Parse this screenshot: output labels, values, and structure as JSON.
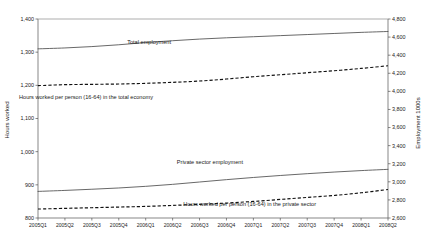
{
  "chart_data": {
    "type": "line",
    "title": "",
    "xlabel": "",
    "ylabel": "Hours worked",
    "y2label": "Employment 1000s",
    "grid": false,
    "legend_position": "inline-annotations",
    "categories": [
      "2005Q1",
      "2005Q2",
      "2005Q3",
      "2005Q4",
      "2006Q1",
      "2006Q2",
      "2006Q3",
      "2006Q4",
      "2007Q1",
      "2007Q2",
      "2007Q3",
      "2007Q4",
      "2008Q1",
      "2008Q2"
    ],
    "ylim": [
      800,
      1400
    ],
    "yticks": [
      "800",
      "900",
      "1,000",
      "1,100",
      "1,200",
      "1,300",
      "1,400"
    ],
    "y2lim": [
      2600,
      4800
    ],
    "y2ticks": [
      "2,600",
      "2,800",
      "3,000",
      "3,200",
      "3,400",
      "3,600",
      "3,800",
      "4,000",
      "4,200",
      "4,400",
      "4,600",
      "4,800"
    ],
    "series": [
      {
        "name": "Total employment",
        "axis": "right",
        "style": "solid",
        "label": "Total employment",
        "values": [
          4470,
          4480,
          4495,
          4515,
          4540,
          4560,
          4578,
          4592,
          4604,
          4616,
          4628,
          4640,
          4652,
          4662
        ]
      },
      {
        "name": "Hours worked per person (16-64) in the total economy",
        "axis": "left",
        "style": "dashed",
        "label": "Hours worked per person (16-64) in the total economy",
        "values": [
          1199,
          1202,
          1203,
          1204,
          1206,
          1209,
          1213,
          1219,
          1226,
          1232,
          1238,
          1244,
          1251,
          1259
        ]
      },
      {
        "name": "Private sector employment",
        "axis": "right",
        "style": "solid",
        "label": "Private sector employment",
        "values": [
          2894,
          2905,
          2918,
          2932,
          2950,
          2972,
          2998,
          3024,
          3048,
          3070,
          3090,
          3108,
          3124,
          3138
        ]
      },
      {
        "name": "Hours worked per person (16-64) in the private sector",
        "axis": "left",
        "style": "dashed",
        "label": "Hours worked per person (16-64) in the private sector",
        "values": [
          827,
          829,
          831,
          833,
          835,
          838,
          841,
          845,
          850,
          856,
          862,
          868,
          876,
          886
        ]
      }
    ],
    "annotations": [
      {
        "text": "Total employment",
        "x": 171,
        "y": 44
      },
      {
        "text": "Hours worked per person (16-64) in the total economy",
        "x": 153,
        "y": 99
      },
      {
        "text": "Private sector employment",
        "x": 243,
        "y": 164
      },
      {
        "text": "Hours worked per person (16-64) in the private sector",
        "x": 316,
        "y": 206
      }
    ]
  }
}
